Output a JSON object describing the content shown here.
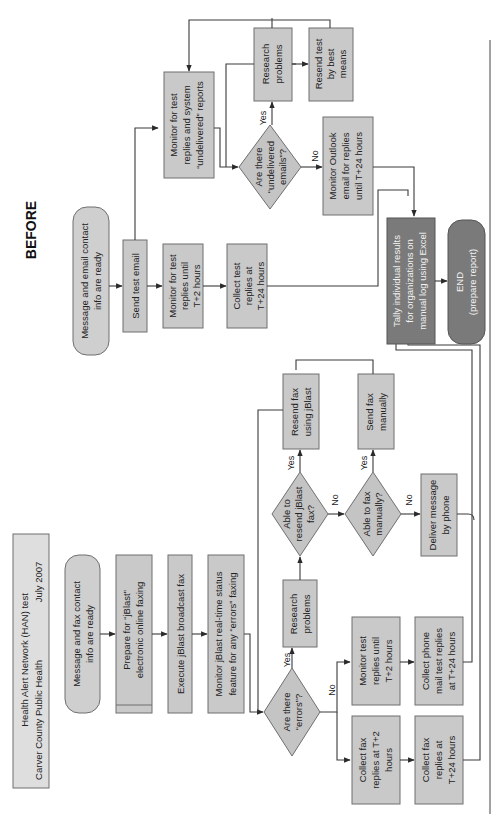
{
  "diagram": {
    "orientation": "rotated 90 degrees counter-clockwise",
    "section_label": "BEFORE",
    "title": {
      "line1": "Health Alert Network (HAN) test",
      "line2": "Carver County Public Health",
      "date": "July 2007"
    },
    "fax_branch": {
      "start": [
        "Message and fax contact",
        "info are ready"
      ],
      "prepare": [
        "Prepare for “jBlast”",
        "electronic online faxing"
      ],
      "execute": [
        "Execute jBlast broadcast fax"
      ],
      "monitor": [
        "Monitor jBlast real-time status",
        "feature for any “errors” faxing"
      ],
      "decision_errors": [
        "Are there",
        "“errors”?"
      ],
      "research": [
        "Research",
        "problems"
      ],
      "decision_resend": [
        "Able to",
        "resend jBlast",
        "fax?"
      ],
      "resend": [
        "Resend fax",
        "using jBlast"
      ],
      "decision_manual": [
        "Able to fax",
        "manually?"
      ],
      "send_manual": [
        "Send fax",
        "manually"
      ],
      "deliver_phone": [
        "Deliver message",
        "by phone"
      ],
      "monitor_replies": [
        "Monitor test",
        "replies until",
        "T+2 hours"
      ],
      "collect_phone": [
        "Collect phone",
        "mail test replies",
        "at T+24 hours"
      ],
      "collect_fax_2": [
        "Collect fax",
        "replies at T+2",
        "hours"
      ],
      "collect_fax_24": [
        "Collect fax",
        "replies at",
        "T+24 hours"
      ]
    },
    "email_branch": {
      "start": [
        "Message and email contact",
        "info are ready"
      ],
      "send": [
        "Send test email"
      ],
      "monitor_2h": [
        "Monitor for test",
        "replies until",
        "T+2 hours"
      ],
      "collect_24h": [
        "Collect test",
        "replies at",
        "T+24 hours"
      ],
      "monitor_undelivered": [
        "Monitor for test",
        "replies and system",
        "“undelivered” reports"
      ],
      "decision_undelivered": [
        "Are there",
        "“undelivered",
        "emails”?"
      ],
      "research": [
        "Research",
        "problems"
      ],
      "resend": [
        "Resend test",
        "by best",
        "means"
      ],
      "monitor_outlook": [
        "Monitor Outlook",
        "email for replies",
        "until T+24 hours"
      ]
    },
    "tally": [
      "Tally individual results",
      "for organizations on",
      "manual log using Excel"
    ],
    "end": [
      "END",
      "(prepare report)"
    ],
    "labels": {
      "yes": "Yes",
      "no": "No"
    },
    "colors": {
      "box": "#c9c9c9",
      "box_dark": "#7a7a7a",
      "stroke": "#6f6f6f",
      "line": "#3a3a3a",
      "background": "#ffffff"
    }
  }
}
